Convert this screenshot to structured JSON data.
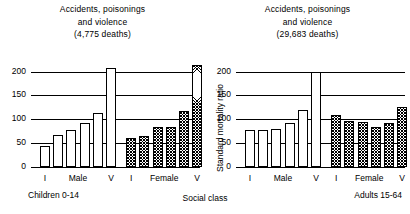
{
  "chart_data": {
    "type": "bar",
    "xlabel": "Social class",
    "ylabel": "Standard mortality ratio",
    "ylim": [
      0,
      220
    ],
    "yticks": [
      0,
      50,
      100,
      150,
      200
    ],
    "grid": true,
    "legend": "none",
    "categories": [
      "I",
      "II",
      "III",
      "IV",
      "V",
      "VI"
    ],
    "panels": [
      {
        "name": "children",
        "title_lines": [
          "Accidents, poisonings",
          "and violence",
          "(4,775 deaths)"
        ],
        "footer": "Children 0-14",
        "groups": [
          {
            "name": "Male",
            "fill": "open",
            "start_label": "I",
            "end_label": "V",
            "values": [
              45,
              67,
              77,
              92,
              113,
              208
            ]
          },
          {
            "name": "Female",
            "fill": "hatched",
            "start_label": "I",
            "end_label": "V",
            "values": [
              60,
              65,
              84,
              84,
              117,
              214
            ]
          }
        ]
      },
      {
        "name": "adults",
        "title_lines": [
          "Accidents, poisonings",
          "and violence",
          "(29,683 deaths)"
        ],
        "footer": "Adults 15-64",
        "groups": [
          {
            "name": "Male",
            "fill": "open",
            "start_label": "I",
            "end_label": "V",
            "values": [
              78,
              78,
              80,
              93,
              120,
              200
            ]
          },
          {
            "name": "Female",
            "fill": "hatched",
            "start_label": "I",
            "end_label": "V",
            "values": [
              108,
              97,
              95,
              84,
              93,
              125
            ]
          }
        ]
      }
    ]
  }
}
